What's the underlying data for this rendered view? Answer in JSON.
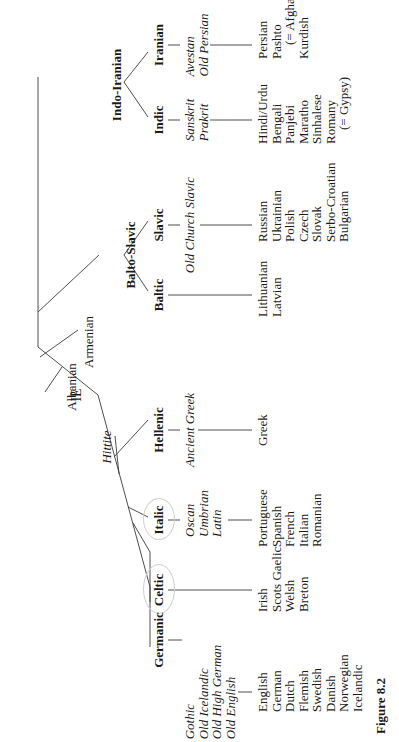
{
  "figure_label": "Figure 8.2",
  "root": "IE",
  "isolates": {
    "hittite": "Hittite",
    "albanian": "Albanian",
    "armenian": "Armenian"
  },
  "intermediate": {
    "balto_slavic": "Balto-Slavic",
    "indo_iranian": "Indo-Iranian"
  },
  "branches": {
    "germanic": {
      "name": "Germanic",
      "ancient": [
        "Gothic",
        "Old Icelandic",
        "Old High German",
        "Old English"
      ],
      "modern": [
        "English",
        "German",
        "Dutch",
        "Flemish",
        "Swedish",
        "Danish",
        "Norwegian",
        "Icelandic"
      ]
    },
    "celtic": {
      "name": "Celtic",
      "ancient": [],
      "modern": [
        "Irish",
        "Scots Gaelic",
        "Welsh",
        "Breton"
      ]
    },
    "italic": {
      "name": "Italic",
      "ancient": [
        "Oscan",
        "Umbrian",
        "Latin"
      ],
      "modern": [
        "Portuguese",
        "Spanish",
        "French",
        "Italian",
        "Romanian"
      ]
    },
    "hellenic": {
      "name": "Hellenic",
      "ancient": [
        "Ancient Greek"
      ],
      "modern": [
        "Greek"
      ]
    },
    "baltic": {
      "name": "Baltic",
      "ancient": [],
      "modern": [
        "Lithuanian",
        "Latvian"
      ]
    },
    "slavic": {
      "name": "Slavic",
      "ancient": [
        "Old Church Slavic"
      ],
      "modern": [
        "Russian",
        "Ukrainian",
        "Polish",
        "Czech",
        "Slovak",
        "Serbo-Croatian",
        "Bulgarian"
      ]
    },
    "indic": {
      "name": "Indic",
      "ancient": [
        "Sanskrit",
        "Prakrit"
      ],
      "modern": [
        "Hindi/Urdu",
        "Bengali",
        "Panjebi",
        "Maratho",
        "Sinhalese",
        "Romany",
        "(= Gypsy)"
      ]
    },
    "iranian": {
      "name": "Iranian",
      "ancient": [
        "Avestan",
        "Old Persian"
      ],
      "modern": [
        "Persian",
        "Pashto",
        "(= Afghani)",
        "Kurdish"
      ]
    }
  },
  "colors": {
    "ink": "#1a1a1a",
    "lines": "#3a3a3a",
    "background": "#ffffff",
    "pencil_circles": "#cfcfcf"
  }
}
